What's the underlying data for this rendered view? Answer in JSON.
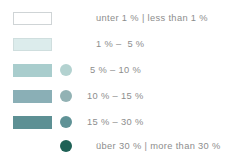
{
  "legend": {
    "title": "",
    "text_color": "#8d8d8d",
    "background": "#ffffff",
    "rows": [
      {
        "label": "unter 1 % | less than 1 %",
        "label_de": "unter 1 %",
        "label_en": "less than 1 %",
        "range_min": 0,
        "range_max": 1,
        "rect_color": "#ffffff",
        "rect_border": "#cfd4d6",
        "has_rect": true,
        "has_circle": false,
        "circle_color": ""
      },
      {
        "label": "1 % –  5 %",
        "range_min": 1,
        "range_max": 5,
        "rect_color": "#dcecec",
        "rect_border": "#cfdede",
        "has_rect": true,
        "has_circle": false,
        "circle_color": ""
      },
      {
        "label": "5 % – 10 %",
        "range_min": 5,
        "range_max": 10,
        "rect_color": "#a9cdcd",
        "rect_border": "#a9cdcd",
        "has_rect": true,
        "has_circle": true,
        "circle_color": "#b3d2d0"
      },
      {
        "label": "10 % – 15 %",
        "range_min": 10,
        "range_max": 15,
        "rect_color": "#8aafb6",
        "rect_border": "#8aafb6",
        "has_rect": true,
        "has_circle": true,
        "circle_color": "#92b2b4"
      },
      {
        "label": "15 % – 30 %",
        "range_min": 15,
        "range_max": 30,
        "rect_color": "#5d9094",
        "rect_border": "#5d9094",
        "has_rect": true,
        "has_circle": true,
        "circle_color": "#5f9296"
      },
      {
        "label": "über 30 % | more than 30 %",
        "label_de": "über 30 %",
        "label_en": "more than 30 %",
        "range_min": 30,
        "range_max": null,
        "rect_color": "",
        "rect_border": "",
        "has_rect": false,
        "has_circle": true,
        "circle_color": "#1f6156"
      }
    ]
  }
}
